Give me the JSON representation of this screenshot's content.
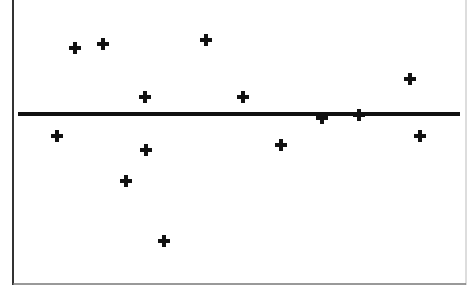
{
  "chart_data": {
    "type": "scatter",
    "title": "",
    "xlabel": "",
    "ylabel": "",
    "grid": false,
    "legend": null,
    "reference_line": {
      "orientation": "horizontal",
      "y": 0,
      "label": ""
    },
    "marker": "plus",
    "points_px": [
      {
        "x": 57,
        "y": 136
      },
      {
        "x": 75,
        "y": 48
      },
      {
        "x": 103,
        "y": 44
      },
      {
        "x": 126,
        "y": 181
      },
      {
        "x": 145,
        "y": 97
      },
      {
        "x": 146,
        "y": 150
      },
      {
        "x": 164,
        "y": 241
      },
      {
        "x": 206,
        "y": 40
      },
      {
        "x": 243,
        "y": 97
      },
      {
        "x": 281,
        "y": 145
      },
      {
        "x": 322,
        "y": 118
      },
      {
        "x": 359,
        "y": 115
      },
      {
        "x": 410,
        "y": 79
      },
      {
        "x": 420,
        "y": 136
      }
    ],
    "x": [
      1,
      2,
      3,
      4,
      5,
      6,
      7,
      8,
      9,
      10,
      11,
      12,
      13,
      14
    ],
    "y": [
      -0.3,
      0.9,
      1.0,
      -0.9,
      0.2,
      -0.5,
      -1.7,
      1.0,
      0.2,
      -0.4,
      -0.05,
      0.0,
      0.5,
      -0.3
    ],
    "colors": {
      "marker": "#111111",
      "line": "#111111",
      "frame": "#333333",
      "background": "#ffffff"
    }
  }
}
